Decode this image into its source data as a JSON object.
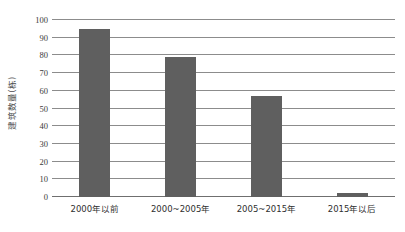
{
  "chart_data": {
    "type": "bar",
    "title": "",
    "xlabel": "",
    "ylabel": "建筑数量(栋)",
    "categories": [
      "2000年以前",
      "2000~2005年",
      "2005~2015年",
      "2015年以后"
    ],
    "values": [
      95,
      79,
      57,
      2
    ],
    "series": [
      {
        "name": "建筑数量(栋)",
        "values": [
          95,
          79,
          57,
          2
        ]
      }
    ],
    "ylim": [
      0,
      100
    ],
    "y_ticks": [
      0,
      10,
      20,
      30,
      40,
      50,
      60,
      70,
      80,
      90,
      100
    ],
    "y_tick_labels": [
      "0",
      "10",
      "20",
      "30",
      "40",
      "50",
      "60",
      "70",
      "80",
      "90",
      "100"
    ],
    "grid": true,
    "grid_axis": "y",
    "legend": false,
    "legend_position": "none",
    "bar_color": "#5f5f5f",
    "gridline_color": "#8c8c8c",
    "background_color": "#ffffff"
  }
}
